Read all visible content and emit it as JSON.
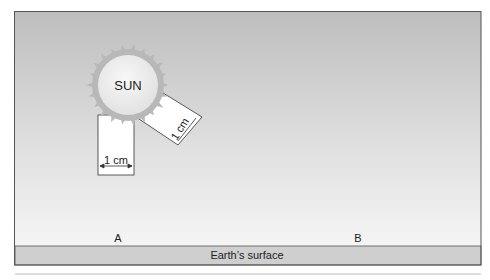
{
  "diagram": {
    "sun_label": "SUN",
    "beam_vertical_label": "1 cm",
    "beam_angled_label": "1 cm",
    "point_a": "A",
    "point_b": "B",
    "surface_label": "Earth’s surface"
  },
  "colors": {
    "sky_top": "#b9b9b9",
    "sky_bottom": "#f4f4f4",
    "sun_fill": "#ececec",
    "sun_rays": "#b5b5b5",
    "beam_fill": "#ffffff",
    "surface": "#cfcfcf",
    "border": "#555555"
  }
}
